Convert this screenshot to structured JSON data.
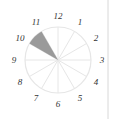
{
  "diagram": {
    "type": "clock-sector-diagram",
    "sectors": 12,
    "shaded_sector": {
      "from": 10,
      "to": 11,
      "color": "#9a9a9a"
    },
    "labels": [
      "12",
      "1",
      "2",
      "3",
      "4",
      "5",
      "6",
      "7",
      "8",
      "9",
      "10",
      "11"
    ],
    "rim_color": "#e6e6e6",
    "divider_color": "#d8d8d8"
  }
}
